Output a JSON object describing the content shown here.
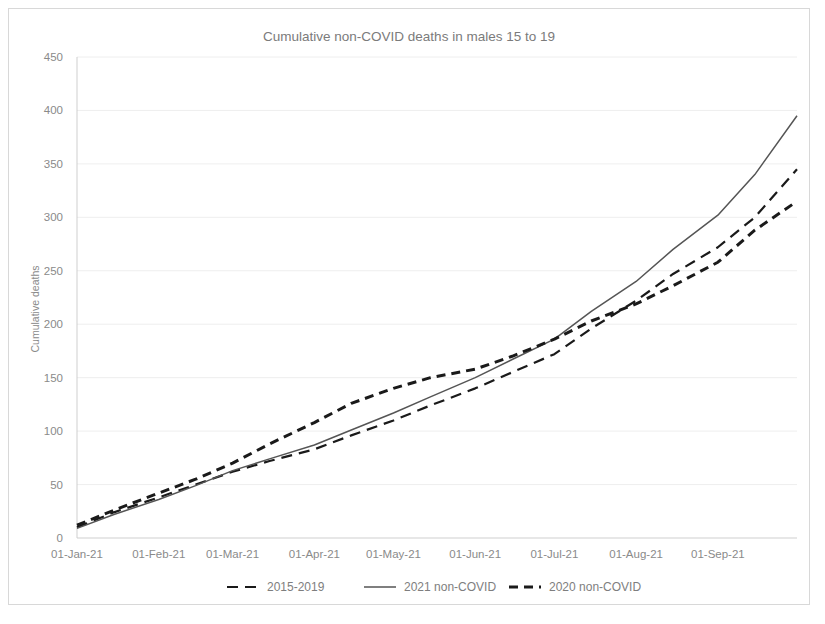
{
  "chart_data": {
    "type": "line",
    "title": "Cumulative non-COVID deaths in males 15 to 19",
    "xlabel": "",
    "ylabel": "Cumulative deaths",
    "ylim": [
      0,
      450
    ],
    "ytick_step": 50,
    "yticks": [
      "0",
      "50",
      "100",
      "150",
      "200",
      "250",
      "300",
      "350",
      "400",
      "450"
    ],
    "xticks": [
      "01-Jan-21",
      "01-Feb-21",
      "01-Mar-21",
      "01-Apr-21",
      "01-May-21",
      "01-Jun-21",
      "01-Jul-21",
      "01-Aug-21",
      "01-Sep-21"
    ],
    "xlim_days": [
      0,
      273
    ],
    "grid": "horizontal",
    "legend_position": "bottom",
    "series": [
      {
        "name": "2015-2019",
        "style": "dashed",
        "color": "#1a1a1a",
        "width": 2.2,
        "dasharray": "11,7",
        "x_days": [
          0,
          14,
          31,
          45,
          59,
          73,
          90,
          104,
          120,
          134,
          151,
          165,
          181,
          195,
          212,
          226,
          243,
          257,
          273
        ],
        "values": [
          10,
          24,
          38,
          50,
          62,
          72,
          83,
          96,
          110,
          124,
          140,
          155,
          172,
          196,
          222,
          247,
          272,
          300,
          345
        ]
      },
      {
        "name": "2021 non-COVID",
        "style": "solid",
        "color": "#555555",
        "width": 1.5,
        "dasharray": "none",
        "x_days": [
          0,
          14,
          31,
          45,
          59,
          73,
          90,
          104,
          120,
          134,
          151,
          165,
          181,
          195,
          212,
          226,
          243,
          257,
          273
        ],
        "values": [
          9,
          22,
          36,
          49,
          63,
          74,
          87,
          101,
          117,
          132,
          150,
          167,
          186,
          212,
          240,
          270,
          302,
          340,
          395
        ]
      },
      {
        "name": "2020 non-COVID",
        "style": "dashed",
        "color": "#1a1a1a",
        "width": 3.0,
        "dasharray": "9,6",
        "x_days": [
          0,
          14,
          31,
          45,
          59,
          73,
          90,
          104,
          120,
          134,
          151,
          165,
          181,
          195,
          212,
          226,
          243,
          257,
          273
        ],
        "values": [
          12,
          26,
          42,
          55,
          70,
          88,
          108,
          126,
          140,
          150,
          158,
          170,
          186,
          203,
          219,
          236,
          258,
          288,
          315
        ]
      }
    ],
    "legend_entries": [
      {
        "label": "2015-2019",
        "style": "dashed",
        "color": "#1a1a1a",
        "width": 2.2,
        "dasharray": "11,7"
      },
      {
        "label": "2021 non-COVID",
        "style": "solid",
        "color": "#555555",
        "width": 1.5,
        "dasharray": "none"
      },
      {
        "label": "2020 non-COVID",
        "style": "dashed",
        "color": "#1a1a1a",
        "width": 3.0,
        "dasharray": "9,6"
      }
    ]
  }
}
